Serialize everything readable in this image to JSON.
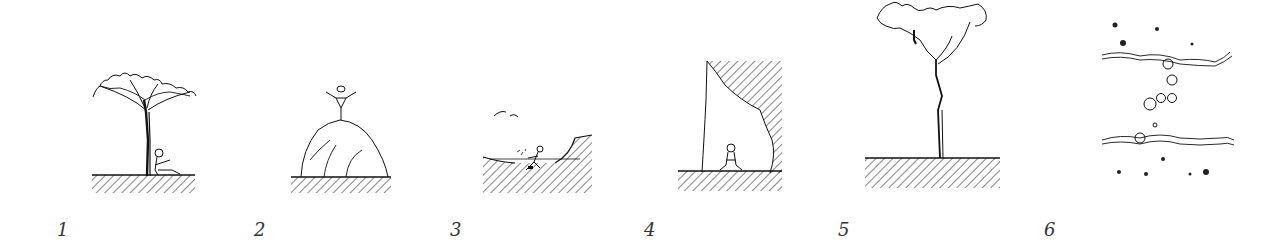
{
  "figure": {
    "background": "#ffffff",
    "ink_color": "#1a1a1a",
    "panels": [
      {
        "number": "1",
        "scene": "person sitting under a tree on hatched ground"
      },
      {
        "number": "2",
        "scene": "person with raised arms standing on top of a rounded hill"
      },
      {
        "number": "3",
        "scene": "person crouching in a hollow / depression with birds above"
      },
      {
        "number": "4",
        "scene": "person sitting in a cave-like shelter beneath an overhanging hatched wall"
      },
      {
        "number": "5",
        "scene": "person climbing in the crown of a tall thin tree"
      },
      {
        "number": "6",
        "scene": "plan view: stepping-stone path crossing between two wavy lines, scattered dots"
      }
    ]
  }
}
